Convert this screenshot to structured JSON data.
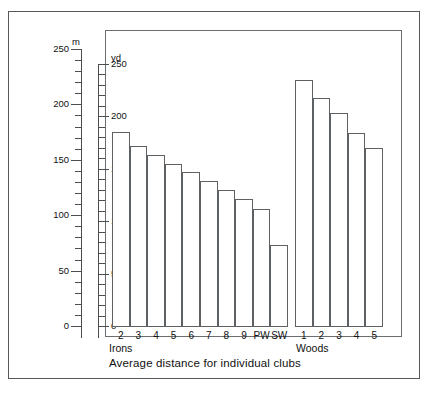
{
  "axes": {
    "left_unit": "m",
    "right_unit": "yd",
    "left_ticks": [
      0,
      50,
      100,
      150,
      200,
      250
    ],
    "right_ticks": [
      0,
      50,
      100,
      150,
      200,
      250
    ]
  },
  "caption": "Average distance for individual clubs",
  "groups": {
    "irons_label": "Irons",
    "woods_label": "Woods"
  },
  "chart_data": {
    "type": "bar",
    "title": "Average distance for individual clubs",
    "xlabel": "",
    "ylabel": "Distance",
    "y_units_primary": "m",
    "y_units_secondary": "yd",
    "ylim": [
      0,
      250
    ],
    "ylim_secondary": [
      0,
      250
    ],
    "grid": false,
    "legend": "none",
    "groups": [
      {
        "name": "Irons",
        "categories": [
          "2",
          "3",
          "4",
          "5",
          "6",
          "7",
          "8",
          "9",
          "PW",
          "SW"
        ],
        "values_yd": [
          185,
          172,
          163,
          155,
          147,
          138,
          130,
          121,
          112,
          77
        ],
        "values_m": [
          169,
          157,
          149,
          142,
          134,
          126,
          119,
          111,
          102,
          70
        ]
      },
      {
        "name": "Woods",
        "categories": [
          "1",
          "2",
          "3",
          "4",
          "5"
        ],
        "values_yd": [
          235,
          218,
          203,
          184,
          170
        ],
        "values_m": [
          215,
          199,
          186,
          168,
          155
        ]
      }
    ]
  }
}
